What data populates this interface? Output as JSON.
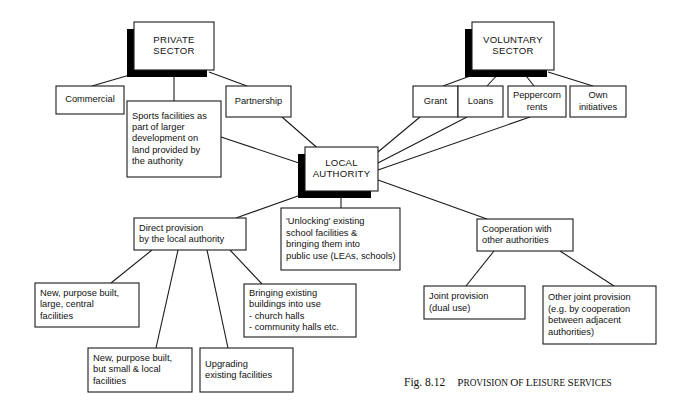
{
  "figure": {
    "number": "Fig. 8.12",
    "title_words": [
      "Provision",
      "of",
      "leisure",
      "services"
    ],
    "title_plain": "Provision of leisure services"
  },
  "colors": {
    "box_fill": "#ffffff",
    "line": "#1a1a1a",
    "shadow": "#000000",
    "text": "#111111",
    "background": "#ffffff"
  },
  "nodes": {
    "private_sector": {
      "label": "PRIVATE SECTOR",
      "lines": [
        "PRIVATE",
        "SECTOR"
      ],
      "x": 134,
      "y": 22,
      "w": 80,
      "h": 48,
      "shadow": true,
      "align": "center"
    },
    "voluntary_sector": {
      "label": "VOLUNTARY SECTOR",
      "lines": [
        "VOLUNTARY",
        "SECTOR"
      ],
      "x": 472,
      "y": 22,
      "w": 82,
      "h": 48,
      "shadow": true,
      "align": "center"
    },
    "local_authority": {
      "label": "LOCAL AUTHORITY",
      "lines": [
        "LOCAL",
        "AUTHORITY"
      ],
      "x": 305,
      "y": 147,
      "w": 73,
      "h": 44,
      "shadow": true,
      "align": "center"
    },
    "commercial": {
      "label": "Commercial",
      "lines": [
        "Commercial"
      ],
      "x": 56,
      "y": 86,
      "w": 68,
      "h": 28,
      "shadow": false,
      "align": "center"
    },
    "partnership": {
      "label": "Partnership",
      "lines": [
        "Partnership"
      ],
      "x": 226,
      "y": 86,
      "w": 65,
      "h": 31,
      "shadow": false,
      "align": "center"
    },
    "sports_facilities": {
      "label": "Sports facilities as part of larger development on land provided by the authority",
      "lines": [
        "Sports facilities as",
        "part of larger",
        "development on",
        "land provided by",
        "the authority"
      ],
      "x": 127,
      "y": 101,
      "w": 94,
      "h": 76,
      "shadow": false,
      "align": "left"
    },
    "grant": {
      "label": "Grant",
      "lines": [
        "Grant"
      ],
      "x": 413,
      "y": 86,
      "w": 45,
      "h": 31,
      "shadow": false,
      "align": "center"
    },
    "loans": {
      "label": "Loans",
      "lines": [
        "Loans"
      ],
      "x": 458,
      "y": 86,
      "w": 45,
      "h": 31,
      "shadow": false,
      "align": "center"
    },
    "peppercorn": {
      "label": "Peppercorn rents",
      "lines": [
        "Peppercorn",
        "rents"
      ],
      "x": 508,
      "y": 86,
      "w": 58,
      "h": 31,
      "shadow": false,
      "align": "center"
    },
    "own_initiatives": {
      "label": "Own initiatives",
      "lines": [
        "Own",
        "initiatives"
      ],
      "x": 570,
      "y": 86,
      "w": 56,
      "h": 31,
      "shadow": false,
      "align": "center"
    },
    "direct_provision": {
      "label": "Direct provision by the local authority",
      "lines": [
        "Direct provision",
        "by the local authority"
      ],
      "x": 134,
      "y": 218,
      "w": 112,
      "h": 32,
      "shadow": false,
      "align": "left"
    },
    "unlocking": {
      "label": "'Unlocking' existing school facilities & bringing them into public use (LEAs, schools)",
      "lines": [
        "'Unlocking' existing",
        "school facilities &",
        "bringing them into",
        "public use (LEAs, schools)"
      ],
      "x": 281,
      "y": 208,
      "w": 119,
      "h": 62,
      "shadow": false,
      "align": "left"
    },
    "cooperation": {
      "label": "Cooperation with other authorities",
      "lines": [
        "Cooperation with",
        "other authorities"
      ],
      "x": 477,
      "y": 219,
      "w": 96,
      "h": 32,
      "shadow": false,
      "align": "left"
    },
    "new_large": {
      "label": "New, purpose built, large, central facilities",
      "lines": [
        "New, purpose built,",
        "large, central",
        "facilities"
      ],
      "x": 35,
      "y": 283,
      "w": 104,
      "h": 44,
      "shadow": false,
      "align": "left"
    },
    "new_small": {
      "label": "New, purpose built, but small & local facilities",
      "lines": [
        "New, purpose built,",
        "but small & local",
        "facilities"
      ],
      "x": 88,
      "y": 348,
      "w": 104,
      "h": 44,
      "shadow": false,
      "align": "left"
    },
    "upgrading": {
      "label": "Upgrading existing facilities",
      "lines": [
        "Upgrading",
        "existing facilities"
      ],
      "x": 200,
      "y": 348,
      "w": 93,
      "h": 44,
      "shadow": false,
      "align": "left"
    },
    "bringing_buildings": {
      "label": "Bringing existing buildings into use - church halls - community halls etc.",
      "lines": [
        "Bringing existing",
        "buildings into use",
        "-  church halls",
        "-  community halls etc."
      ],
      "x": 244,
      "y": 284,
      "w": 112,
      "h": 53,
      "shadow": false,
      "align": "left"
    },
    "joint_provision": {
      "label": "Joint provision (dual use)",
      "lines": [
        "Joint provision",
        "(dual use)"
      ],
      "x": 424,
      "y": 286,
      "w": 101,
      "h": 33,
      "shadow": false,
      "align": "left"
    },
    "other_joint": {
      "label": "Other joint provision (e.g. by cooperation between adjacent authorities)",
      "lines": [
        "Other joint provision",
        "(e.g. by cooperation",
        "between adjacent",
        "authorities)"
      ],
      "x": 543,
      "y": 286,
      "w": 113,
      "h": 58,
      "shadow": false,
      "align": "left"
    }
  },
  "connections": [
    {
      "from": "private_sector",
      "to": "commercial",
      "path": "M 140,72 L 92,86"
    },
    {
      "from": "private_sector",
      "to": "sports_facilities",
      "path": "M 174,72 L 174,101"
    },
    {
      "from": "private_sector",
      "to": "partnership",
      "path": "M 209,72 L 247,86"
    },
    {
      "from": "sports_facilities",
      "to": "local_authority",
      "path": "M 221,137 L 305,165"
    },
    {
      "from": "partnership",
      "to": "local_authority",
      "path": "M 282,117 L 322,152"
    },
    {
      "from": "voluntary_sector",
      "to": "grant",
      "path": "M 481,72 L 443,86"
    },
    {
      "from": "voluntary_sector",
      "to": "loans",
      "path": "M 500,72 L 487,86"
    },
    {
      "from": "voluntary_sector",
      "to": "peppercorn",
      "path": "M 523,72 L 534,86"
    },
    {
      "from": "voluntary_sector",
      "to": "own_initiatives",
      "path": "M 548,72 L 593,86"
    },
    {
      "from": "local_authority",
      "to": "grant",
      "path": "M 378,152 L 420,117"
    },
    {
      "from": "local_authority",
      "to": "loans",
      "path": "M 378,163 L 467,117"
    },
    {
      "from": "local_authority",
      "to": "peppercorn",
      "path": "M 378,170 L 530,117"
    },
    {
      "from": "local_authority",
      "to": "direct_provision",
      "path": "M 312,191 L 236,218"
    },
    {
      "from": "local_authority",
      "to": "unlocking",
      "path": "M 341,195 L 341,208"
    },
    {
      "from": "local_authority",
      "to": "cooperation",
      "path": "M 378,180 L 487,219"
    },
    {
      "from": "direct_provision",
      "to": "new_large",
      "path": "M 152,250 L 111,283"
    },
    {
      "from": "direct_provision",
      "to": "new_small",
      "path": "M 178,250 L 156,348"
    },
    {
      "from": "direct_provision",
      "to": "upgrading",
      "path": "M 207,250 L 228,348"
    },
    {
      "from": "direct_provision",
      "to": "bringing_buildings",
      "path": "M 230,250 L 262,284"
    },
    {
      "from": "cooperation",
      "to": "joint_provision",
      "path": "M 494,251 L 466,286"
    },
    {
      "from": "cooperation",
      "to": "other_joint",
      "path": "M 560,251 L 614,286"
    }
  ]
}
